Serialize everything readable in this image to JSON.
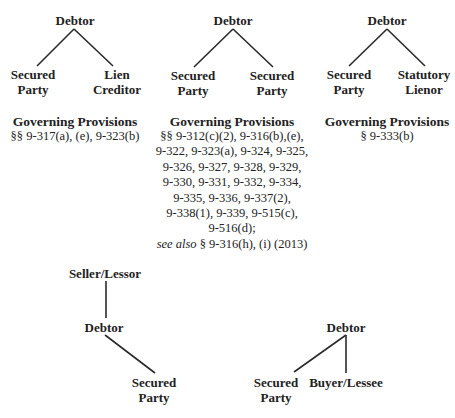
{
  "diagrams": {
    "d1": {
      "root": "Debtor",
      "left": [
        "Secured",
        "Party"
      ],
      "right": [
        "Lien",
        "Creditor"
      ],
      "provisions_title": "Governing Provisions",
      "provisions": [
        "§§ 9-317(a), (e), 9-323(b)"
      ]
    },
    "d2": {
      "root": "Debtor",
      "left": [
        "Secured",
        "Party"
      ],
      "right": [
        "Secured",
        "Party"
      ],
      "provisions_title": "Governing Provisions",
      "provisions": [
        "§§ 9-312(c)(2), 9-316(b),(e),",
        "9-322, 9-323(a), 9-324, 9-325,",
        "9-326, 9-327, 9-328, 9-329,",
        "9-330, 9-331, 9-332, 9-334,",
        "9-335, 9-336, 9-337(2),",
        "9-338(1), 9-339, 9-515(c),",
        "9-516(d);"
      ],
      "see_also_label": "see also",
      "see_also_text": " § 9-316(h), (i) (2013)"
    },
    "d3": {
      "root": "Debtor",
      "left": [
        "Secured",
        "Party"
      ],
      "right": [
        "Statutory",
        "Lienor"
      ],
      "provisions_title": "Governing Provisions",
      "provisions": [
        "§ 9-333(b)"
      ]
    },
    "d4": {
      "top": "Seller/Lessor",
      "middle": "Debtor",
      "bottom": [
        "Secured",
        "Party"
      ]
    },
    "d5": {
      "root": "Debtor",
      "left": [
        "Secured",
        "Party"
      ],
      "right": "Buyer/Lessee"
    }
  }
}
